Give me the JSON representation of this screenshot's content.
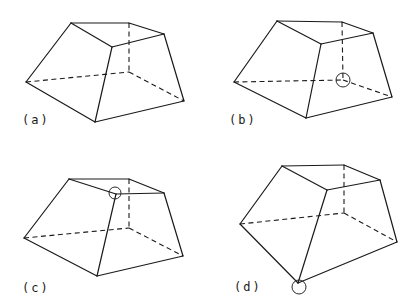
{
  "figure": {
    "width": 417,
    "height": 307,
    "colors": {
      "line": "#1a1a1a",
      "background": "#ffffff"
    },
    "panels": [
      {
        "id": "a",
        "label": "(a)",
        "label_pos": [
          22,
          113
        ],
        "vertices": {
          "top_left": [
            71,
            23
          ],
          "top_back": [
            129,
            23
          ],
          "top_right": [
            164,
            34
          ],
          "top_front": [
            112,
            47
          ],
          "left": [
            26,
            82
          ],
          "back_bottom": [
            129,
            72
          ],
          "right": [
            184,
            101
          ],
          "bottom_front": [
            95,
            122
          ]
        },
        "marker": null
      },
      {
        "id": "b",
        "label": "(b)",
        "label_pos": [
          229,
          113
        ],
        "vertices": {
          "top_left": [
            277,
            21
          ],
          "top_back": [
            342,
            22
          ],
          "top_right": [
            373,
            33
          ],
          "top_front": [
            321,
            44
          ],
          "left": [
            234,
            82
          ],
          "back_bottom": [
            343,
            80
          ],
          "right": [
            392,
            97
          ],
          "bottom_front": [
            306,
            118
          ]
        },
        "marker": {
          "at": "back_bottom",
          "center": [
            343,
            80
          ],
          "r": 7,
          "tick_marks": true
        }
      },
      {
        "id": "c",
        "label": "(c)",
        "label_pos": [
          22,
          281
        ],
        "vertices": {
          "top_left": [
            69,
            179
          ],
          "top_back": [
            129,
            179
          ],
          "top_right": [
            164,
            193
          ],
          "top_front": [
            116,
            194
          ],
          "left": [
            24,
            238
          ],
          "back_bottom": [
            129,
            228
          ],
          "right": [
            183,
            256
          ],
          "bottom_front": [
            97,
            276
          ]
        },
        "marker": {
          "at": "top_front",
          "center": [
            115,
            193
          ],
          "r": 6,
          "tick_marks": false
        }
      },
      {
        "id": "d",
        "label": "(d)",
        "label_pos": [
          234,
          280
        ],
        "vertices": {
          "top_left": [
            282,
            166
          ],
          "top_back": [
            344,
            165
          ],
          "top_right": [
            380,
            180
          ],
          "top_front": [
            327,
            190
          ],
          "left": [
            240,
            224
          ],
          "back_bottom": [
            344,
            213
          ],
          "right": [
            397,
            242
          ],
          "bottom_front": [
            298,
            283
          ]
        },
        "marker": {
          "at": "bottom_front",
          "center": [
            299,
            287
          ],
          "r": 7,
          "tick_marks": false
        }
      }
    ],
    "edges": {
      "solid": [
        [
          "top_left",
          "top_back"
        ],
        [
          "top_back",
          "top_right"
        ],
        [
          "top_right",
          "top_front"
        ],
        [
          "top_front",
          "top_left"
        ],
        [
          "top_left",
          "left"
        ],
        [
          "top_front",
          "bottom_front"
        ],
        [
          "top_right",
          "right"
        ],
        [
          "left",
          "bottom_front"
        ],
        [
          "bottom_front",
          "right"
        ]
      ],
      "hidden": [
        [
          "top_back",
          "back_bottom"
        ],
        [
          "left",
          "back_bottom"
        ],
        [
          "back_bottom",
          "right"
        ]
      ]
    }
  }
}
